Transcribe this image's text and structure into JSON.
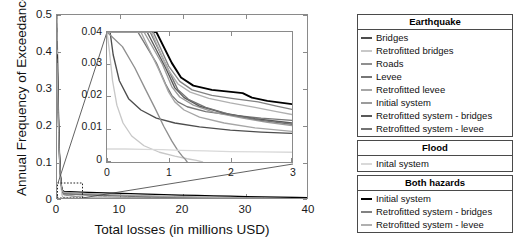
{
  "chart_data": {
    "type": "line",
    "title": "",
    "xlabel": "Total losses (in millions USD)",
    "ylabel": "Annual Frequency of Exceedance",
    "xlim": [
      0,
      40
    ],
    "ylim": [
      0,
      0.5
    ],
    "xticks": [
      "0",
      "10",
      "20",
      "30",
      "40"
    ],
    "yticks": [
      "0",
      "0.1",
      "0.2",
      "0.3",
      "0.4",
      "0.5"
    ],
    "grid": false,
    "legend_position": "right-outside",
    "inset": {
      "xlabel": "",
      "ylabel": "",
      "xlim": [
        0,
        3
      ],
      "ylim": [
        0,
        0.04
      ],
      "xticks": [
        "0",
        "1",
        "2",
        "3"
      ],
      "yticks": [
        "0",
        "0.01",
        "0.02",
        "0.03",
        "0.04"
      ],
      "description": "Magnified view of the region near the origin indicated by the dashed box on the main axes"
    },
    "series": [
      {
        "name": "Earthquake - Bridges",
        "group": "Earthquake",
        "color": "#4d4d4d",
        "x": [
          0.0,
          0.05,
          0.1,
          0.2,
          0.35,
          0.55,
          0.8,
          1.1,
          1.5,
          2.0,
          2.5,
          3.0
        ],
        "y": [
          0.04,
          0.04,
          0.033,
          0.025,
          0.0195,
          0.016,
          0.0135,
          0.012,
          0.0108,
          0.0098,
          0.0092,
          0.0088
        ]
      },
      {
        "name": "Earthquake - Retrofitted bridges",
        "group": "Earthquake",
        "color": "#c8c8c8",
        "x": [
          0.0,
          0.04,
          0.09,
          0.16,
          0.26,
          0.4,
          0.6,
          0.85,
          1.1,
          1.3,
          1.45,
          1.55
        ],
        "y": [
          0.04,
          0.034,
          0.025,
          0.0175,
          0.012,
          0.008,
          0.005,
          0.003,
          0.0018,
          0.001,
          0.0005,
          0.0
        ]
      },
      {
        "name": "Earthquake - Roads",
        "group": "Earthquake",
        "color": "#8f8f8f",
        "x": [
          0.0,
          0.25,
          0.45,
          0.62,
          0.78,
          0.92,
          1.05,
          1.15,
          1.22,
          1.27,
          1.3
        ],
        "y": [
          0.04,
          0.0355,
          0.029,
          0.0225,
          0.0165,
          0.011,
          0.0065,
          0.0035,
          0.0018,
          0.0008,
          0.0
        ]
      },
      {
        "name": "Earthquake - Levee",
        "group": "Earthquake",
        "color": "#767676",
        "x": [
          0.0,
          0.5,
          0.8,
          0.95,
          1.05,
          1.15,
          1.3,
          1.6,
          2.0,
          2.5,
          3.0
        ],
        "y": [
          0.04,
          0.04,
          0.0305,
          0.024,
          0.0205,
          0.0185,
          0.017,
          0.0155,
          0.0145,
          0.0135,
          0.0128
        ]
      },
      {
        "name": "Earthquake - Retrofitted levee",
        "group": "Earthquake",
        "color": "#a6a6a6",
        "x": [
          0.0,
          0.55,
          0.85,
          1.0,
          1.1,
          1.25,
          1.5,
          1.9,
          2.4,
          3.0
        ],
        "y": [
          0.04,
          0.04,
          0.028,
          0.0215,
          0.0185,
          0.016,
          0.0138,
          0.012,
          0.0105,
          0.0094
        ]
      },
      {
        "name": "Earthquake - Initial system",
        "group": "Earthquake",
        "color": "#9b9b9b",
        "x": [
          0.0,
          0.6,
          0.9,
          1.05,
          1.18,
          1.4,
          1.75,
          2.2,
          2.6,
          3.0
        ],
        "y": [
          0.04,
          0.04,
          0.03,
          0.0232,
          0.02,
          0.0175,
          0.0152,
          0.0135,
          0.0122,
          0.0112
        ]
      },
      {
        "name": "Earthquake - Retrofitted system - bridges",
        "group": "Earthquake",
        "color": "#595959",
        "x": [
          0.0,
          0.65,
          0.95,
          1.1,
          1.25,
          1.5,
          1.9,
          2.4,
          3.0
        ],
        "y": [
          0.04,
          0.04,
          0.029,
          0.0228,
          0.0198,
          0.0172,
          0.015,
          0.0133,
          0.012
        ]
      },
      {
        "name": "Earthquake - Retrofitted system - levee",
        "group": "Earthquake",
        "color": "#737373",
        "x": [
          0.0,
          0.7,
          1.0,
          1.15,
          1.32,
          1.6,
          2.0,
          2.5,
          3.0
        ],
        "y": [
          0.04,
          0.04,
          0.0282,
          0.0222,
          0.0193,
          0.0168,
          0.0146,
          0.0128,
          0.0116
        ]
      },
      {
        "name": "Flood - Inital system",
        "group": "Flood",
        "color": "#d9d9d9",
        "x": [
          0.0,
          0.3,
          0.6,
          0.9,
          1.2,
          1.6,
          2.0,
          2.5,
          3.0
        ],
        "y": [
          0.004,
          0.004,
          0.0039,
          0.0038,
          0.0036,
          0.0034,
          0.0032,
          0.0031,
          0.003
        ]
      },
      {
        "name": "Both hazards - Initial system",
        "group": "Both hazards",
        "color": "#000000",
        "x": [
          0.0,
          0.8,
          1.05,
          1.2,
          1.4,
          1.7,
          2.05,
          2.2,
          2.35,
          2.6,
          3.0
        ],
        "y": [
          0.04,
          0.04,
          0.0305,
          0.026,
          0.0235,
          0.0222,
          0.0215,
          0.0212,
          0.0198,
          0.0188,
          0.0178
        ]
      },
      {
        "name": "Both hazards - Retrofitted system - bridges",
        "group": "Both hazards",
        "color": "#828282",
        "x": [
          0.0,
          0.75,
          1.0,
          1.18,
          1.38,
          1.7,
          2.05,
          2.45,
          2.75,
          3.0
        ],
        "y": [
          0.04,
          0.04,
          0.0295,
          0.0248,
          0.0222,
          0.0205,
          0.0195,
          0.0185,
          0.0172,
          0.0162
        ]
      },
      {
        "name": "Both hazards - Retrofitted system - levee",
        "group": "Both hazards",
        "color": "#b0b0b0",
        "x": [
          0.0,
          0.72,
          0.98,
          1.15,
          1.35,
          1.65,
          2.0,
          2.4,
          2.75,
          3.0
        ],
        "y": [
          0.04,
          0.04,
          0.0288,
          0.024,
          0.0215,
          0.0196,
          0.0182,
          0.0168,
          0.0155,
          0.0146
        ]
      }
    ]
  },
  "legend": {
    "groups": [
      {
        "title": "Earthquake",
        "items": [
          {
            "label": "Bridges",
            "color": "#4d4d4d"
          },
          {
            "label": "Retrofitted bridges",
            "color": "#c8c8c8"
          },
          {
            "label": "Roads",
            "color": "#8f8f8f"
          },
          {
            "label": "Levee",
            "color": "#767676"
          },
          {
            "label": "Retrofitted levee",
            "color": "#a6a6a6"
          },
          {
            "label": "Initial system",
            "color": "#9b9b9b"
          },
          {
            "label": "Retrofitted system - bridges",
            "color": "#595959"
          },
          {
            "label": "Retrofitted system - levee",
            "color": "#737373"
          }
        ]
      },
      {
        "title": "Flood",
        "items": [
          {
            "label": "Inital system",
            "color": "#d9d9d9"
          }
        ]
      },
      {
        "title": "Both hazards",
        "items": [
          {
            "label": "Initial system",
            "color": "#000000"
          },
          {
            "label": "Retrofitted system - bridges",
            "color": "#828282"
          },
          {
            "label": "Retrofitted system - levee",
            "color": "#b0b0b0"
          }
        ]
      }
    ]
  }
}
